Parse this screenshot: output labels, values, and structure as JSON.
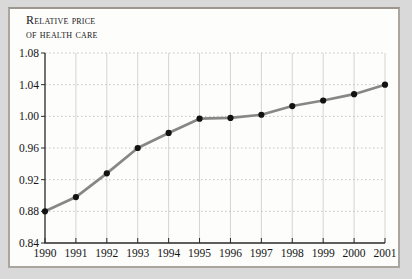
{
  "figure": {
    "title_line1": "Relative price",
    "title_line2": "of health care"
  },
  "chart_data": {
    "type": "line",
    "title": "Relative price of health care",
    "xlabel": "",
    "ylabel": "Relative price of health care",
    "x": [
      "1990",
      "1991",
      "1992",
      "1993",
      "1994",
      "1995",
      "1996",
      "1997",
      "1998",
      "1999",
      "2000",
      "2001"
    ],
    "values": [
      0.88,
      0.898,
      0.928,
      0.96,
      0.979,
      0.997,
      0.998,
      1.002,
      1.013,
      1.02,
      1.028,
      1.04
    ],
    "ylim": [
      0.84,
      1.08
    ],
    "yticks": [
      0.84,
      0.88,
      0.92,
      0.96,
      1.0,
      1.04,
      1.08
    ],
    "grid": "on",
    "legend": "none",
    "colors": {
      "line": "#878787",
      "marker": "#121212",
      "axis": "#2a2a2a",
      "grid_vertical": "#d4d4d4",
      "grid_horizontal": "#c3c3c3",
      "tick_label": "#141414",
      "panel_background": "#fdfdfc",
      "outer_background": "#d9d9d9",
      "frame_border": "#aaa69f"
    }
  }
}
